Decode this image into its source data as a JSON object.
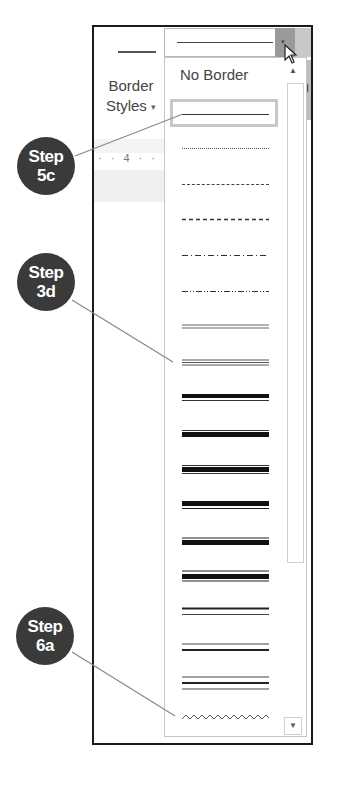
{
  "ribbon": {
    "border_styles_label_line1": "Border",
    "border_styles_label_line2": "Styles",
    "border_styles_caret": "▾",
    "ruler_text": "· · 4 · ·",
    "right_glyph": ")"
  },
  "combo": {
    "selected_value": "single-line",
    "dropdown_arrow": "▾"
  },
  "dropdown": {
    "no_border_label": "No Border",
    "options": [
      {
        "style": "single-line",
        "selected": true
      },
      {
        "style": "dotted"
      },
      {
        "style": "small-dash"
      },
      {
        "style": "large-dash"
      },
      {
        "style": "dash-dot"
      },
      {
        "style": "dash-dot-dot"
      },
      {
        "style": "double"
      },
      {
        "style": "triple"
      },
      {
        "style": "thick-thin-small"
      },
      {
        "style": "thin-thick-small"
      },
      {
        "style": "thin-thick-thin-small"
      },
      {
        "style": "thick-thin-medium"
      },
      {
        "style": "thin-thick-thin-medium"
      },
      {
        "style": "thick-thin-large"
      },
      {
        "style": "thin-thick-large"
      },
      {
        "style": "thin-thick-thin-large"
      },
      {
        "style": "wave"
      }
    ],
    "scroll_up": "▲",
    "scroll_down": "▼"
  },
  "callouts": [
    {
      "label_line1": "Step",
      "label_line2": "5c"
    },
    {
      "label_line1": "Step",
      "label_line2": "3d"
    },
    {
      "label_line1": "Step",
      "label_line2": "6a"
    }
  ],
  "colors": {
    "callout_fill": "#3a3a3a",
    "frame": "#1a1a1a",
    "leader_line": "#8a8a8a"
  }
}
